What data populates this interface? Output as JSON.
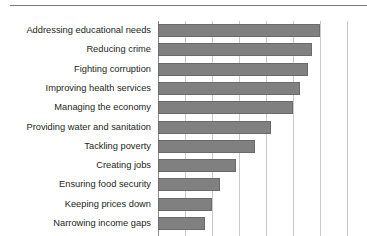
{
  "chart_data": {
    "type": "bar",
    "orientation": "horizontal",
    "title": "",
    "subtitle": "",
    "xlabel": "",
    "ylabel": "",
    "categories": [
      "Addressing educational needs",
      "Reducing crime",
      "Fighting corruption",
      "Improving health services",
      "Managing the economy",
      "Providing water and sanitation",
      "Tackling poverty",
      "Creating jobs",
      "Ensuring food security",
      "Keeping prices down",
      "Narrowing income gaps"
    ],
    "values": [
      60,
      57,
      55.5,
      52.5,
      50,
      42,
      36,
      29,
      23,
      20,
      17.5
    ],
    "xlim": [
      0,
      77.5
    ],
    "gridline_values": [
      10,
      20,
      30,
      40,
      50,
      60,
      70
    ],
    "grid": true,
    "legend": null,
    "tick_labels_visible": false,
    "colors": {
      "bar_fill": "#808080",
      "bar_border": "#6b6b6b",
      "gridline": "#c9c9c9",
      "axis": "#8c8c8c",
      "rule": "#7a7a7a",
      "label_text": "#231f20"
    }
  }
}
